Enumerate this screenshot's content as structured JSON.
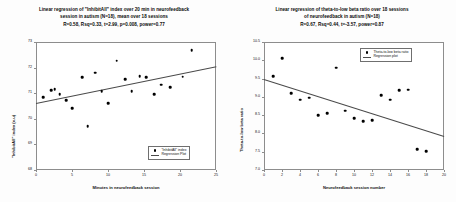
{
  "figure": {
    "panels": [
      {
        "id": "left",
        "title_lines": [
          "Linear regression of \"InhibitAll\" index over 20 min in neurofeedback",
          "session in  autism (N=18), mean over 18 sessions",
          "R=0.58, Rsq=0.33, t=2.99, p=0.008, power=0.77"
        ],
        "legend": {
          "series_label": "\"InhibitAll\" index",
          "fit_label": "Regression Plot"
        }
      },
      {
        "id": "right",
        "title_lines": [
          "Linear regression of theta-to-low beta ratio over 18 sessions",
          "of neurofeedback  in autism (N=18)",
          "R=0.67, Rsq=0.44, t=-3.57, power=0.87"
        ],
        "legend": {
          "series_label": "Theta-to-low beta ratio",
          "fit_label": "Regression plot"
        }
      }
    ]
  },
  "chart_data": [
    {
      "type": "scatter",
      "title": "Linear regression of \"InhibitAll\" index over 20 min in neurofeedback session in  autism (N=18), mean over 18 sessions R=0.58, Rsq=0.33, t=2.99, p=0.008, power=0.77",
      "xlabel": "Minutes in neurofeedback session",
      "ylabel": "\"InhibitAll\" index (x.u)",
      "xlim": [
        0,
        25
      ],
      "ylim": [
        68,
        73
      ],
      "xticks": [
        0,
        5,
        10,
        15,
        20,
        25
      ],
      "yticks": [
        68,
        69,
        70,
        71,
        72,
        73
      ],
      "grid": false,
      "legend_position": "lower-right",
      "stats": {
        "R": 0.58,
        "Rsq": 0.33,
        "t": 2.99,
        "p": 0.008,
        "power": 0.77,
        "N": 18
      },
      "series": [
        {
          "name": "\"InhibitAll\" index",
          "x": [
            1.0,
            2.1,
            2.6,
            3.3,
            4.2,
            5.0,
            6.4,
            7.2,
            8.2,
            9.1,
            10.0,
            11.2,
            12.4,
            13.3,
            14.4,
            15.3,
            16.4,
            17.4,
            18.6,
            20.4,
            21.6
          ],
          "y": [
            70.84,
            71.12,
            71.15,
            70.96,
            70.73,
            70.42,
            71.63,
            69.72,
            71.8,
            71.07,
            70.6,
            72.27,
            71.55,
            71.07,
            71.66,
            71.62,
            70.96,
            71.33,
            71.24,
            71.64,
            72.68
          ]
        }
      ],
      "fit": {
        "name": "Regression Plot",
        "x": [
          0.0,
          25.0
        ],
        "y": [
          70.62,
          72.05
        ]
      }
    },
    {
      "type": "scatter",
      "title": "Linear regression of theta-to-low beta ratio over 18 sessions of neurofeedback  in autism (N=18) R=0.67, Rsq=0.44, t=-3.57, power=0.87",
      "xlabel": "Neurofeedback session number",
      "ylabel": "Theta-to-low beta ratio",
      "xlim": [
        0,
        20
      ],
      "ylim": [
        7.0,
        10.5
      ],
      "xticks": [
        0,
        2,
        4,
        6,
        8,
        10,
        12,
        14,
        16,
        18,
        20
      ],
      "yticks": [
        7.0,
        7.5,
        8.0,
        8.5,
        9.0,
        9.5,
        10.0,
        10.5
      ],
      "grid": false,
      "legend_position": "upper-right",
      "stats": {
        "R": 0.67,
        "Rsq": 0.44,
        "t": -3.57,
        "power": 0.87,
        "N": 18
      },
      "series": [
        {
          "name": "Theta-to-low beta ratio",
          "x": [
            1.0,
            2.0,
            3.0,
            4.0,
            5.0,
            6.0,
            7.0,
            8.0,
            9.0,
            10.0,
            11.0,
            12.0,
            13.0,
            14.0,
            15.0,
            16.0,
            17.0,
            18.0
          ],
          "y": [
            9.56,
            10.06,
            9.1,
            8.92,
            8.98,
            8.5,
            8.56,
            9.8,
            8.62,
            8.42,
            8.34,
            8.36,
            9.05,
            8.92,
            9.18,
            9.2,
            7.57,
            7.52
          ]
        }
      ],
      "fit": {
        "name": "Regression plot",
        "x": [
          0.0,
          20.0
        ],
        "y": [
          9.5,
          7.94
        ]
      }
    }
  ]
}
